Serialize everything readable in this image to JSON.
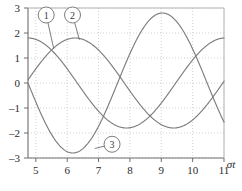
{
  "chart_data": {
    "type": "line",
    "title": "",
    "xlabel": "σt",
    "ylabel": "",
    "xlim": [
      4.75,
      11.0
    ],
    "ylim": [
      -3,
      3
    ],
    "xticks": [
      5,
      6,
      7,
      8,
      9,
      10,
      11
    ],
    "yticks": [
      3,
      2,
      1,
      0,
      -1,
      -2,
      -3
    ],
    "xtick_labels": [
      "5",
      "6",
      "7",
      "8",
      "9",
      "10",
      "11"
    ],
    "ytick_labels": [
      "3",
      "2",
      "1",
      "0",
      "–1",
      "–2",
      "–3"
    ],
    "grid": true,
    "grid_style": "dotted",
    "legend": "callouts",
    "line_color": "#7d7d7d",
    "grid_color": "#c8c8c8",
    "axis_color": "#6e6e6e",
    "series": [
      {
        "name": "1",
        "label": "1",
        "form": "1.8*cos(x - 4.75)",
        "amplitude": 1.8,
        "phase_deg": 0,
        "period": 6.283,
        "x": [
          4.75,
          5.0,
          5.25,
          5.5,
          5.75,
          6.0,
          6.25,
          6.5,
          6.75,
          7.0,
          7.25,
          7.5,
          7.75,
          8.0,
          8.25,
          8.5,
          8.75,
          9.0,
          9.25,
          9.5,
          9.75,
          10.0,
          10.25,
          10.5,
          10.75,
          11.0
        ],
        "y": [
          1.8,
          1.74,
          1.57,
          1.29,
          0.93,
          0.51,
          0.05,
          -0.41,
          -0.85,
          -1.23,
          -1.53,
          -1.73,
          -1.8,
          -1.76,
          -1.6,
          -1.33,
          -0.98,
          -0.57,
          -0.11,
          0.35,
          0.79,
          1.18,
          1.5,
          1.71,
          1.8,
          1.77
        ]
      },
      {
        "name": "2",
        "label": "2",
        "form": "1.8*cos(x - 4.75 - 1.5)",
        "amplitude": 1.8,
        "phase_deg": 86,
        "period": 6.283,
        "x": [
          4.75,
          5.0,
          5.25,
          5.5,
          5.75,
          6.0,
          6.25,
          6.5,
          6.75,
          7.0,
          7.25,
          7.5,
          7.75,
          8.0,
          8.25,
          8.5,
          8.75,
          9.0,
          9.25,
          9.5,
          9.75,
          10.0,
          10.25,
          10.5,
          10.75,
          11.0
        ],
        "y": [
          0.13,
          0.57,
          0.99,
          1.34,
          1.61,
          1.76,
          1.8,
          1.71,
          1.51,
          1.2,
          0.81,
          0.37,
          -0.09,
          -0.54,
          -0.96,
          -1.32,
          -1.59,
          -1.76,
          -1.8,
          -1.72,
          -1.53,
          -1.23,
          -0.85,
          -0.41,
          0.05,
          0.51
        ]
      },
      {
        "name": "3",
        "label": "3",
        "form": "2.8*sin(-(x - 4.75)*1.1)",
        "amplitude": 2.8,
        "phase_deg": 180,
        "period": 5.7,
        "x": [
          4.75,
          5.0,
          5.25,
          5.5,
          5.75,
          6.0,
          6.25,
          6.5,
          6.75,
          7.0,
          7.25,
          7.5,
          7.75,
          8.0,
          8.25,
          8.5,
          8.75,
          9.0,
          9.25,
          9.5,
          9.75,
          10.0,
          10.25,
          10.5,
          10.75,
          11.0
        ],
        "y": [
          0.0,
          -0.74,
          -1.44,
          -2.05,
          -2.5,
          -2.74,
          -2.79,
          -2.63,
          -2.25,
          -1.7,
          -1.02,
          -0.28,
          0.48,
          1.2,
          1.85,
          2.39,
          2.7,
          2.78,
          2.64,
          2.28,
          1.74,
          1.07,
          0.33,
          -0.44,
          -1.16,
          -1.83
        ]
      }
    ],
    "callouts": [
      {
        "label": "1",
        "circle_x": 5.33,
        "circle_y": 2.72,
        "anchor_x": 5.57,
        "anchor_y": 1.38
      },
      {
        "label": "2",
        "circle_x": 6.17,
        "circle_y": 2.72,
        "anchor_x": 6.39,
        "anchor_y": 1.73
      },
      {
        "label": "3",
        "circle_x": 7.43,
        "circle_y": -2.45,
        "anchor_x": 6.88,
        "anchor_y": -2.62
      }
    ]
  }
}
